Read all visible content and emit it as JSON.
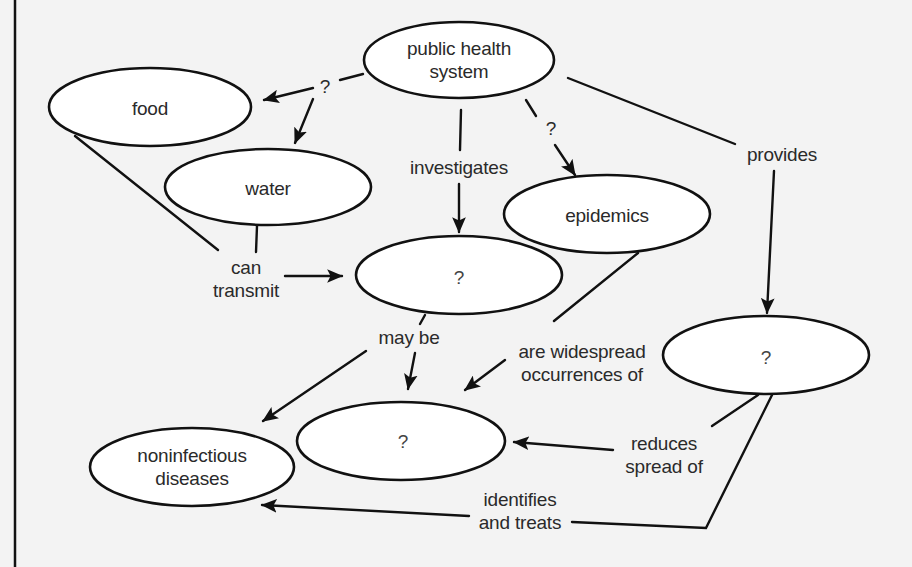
{
  "diagram": {
    "type": "concept-map",
    "colors": {
      "background": "#f3f3f3",
      "node_fill": "#ffffff",
      "stroke": "#111111",
      "text": "#2a2a2a"
    },
    "nodes": [
      {
        "id": "public_health_system",
        "label": "public health\nsystem",
        "cx": 459,
        "cy": 60,
        "rx": 95,
        "ry": 38
      },
      {
        "id": "food",
        "label": "food",
        "cx": 150,
        "cy": 107,
        "rx": 101,
        "ry": 39
      },
      {
        "id": "water",
        "label": "water",
        "cx": 268,
        "cy": 187,
        "rx": 103,
        "ry": 38
      },
      {
        "id": "epidemics",
        "label": "epidemics",
        "cx": 607,
        "cy": 214,
        "rx": 103,
        "ry": 39
      },
      {
        "id": "unknown_center",
        "label": "?",
        "cx": 459,
        "cy": 275,
        "rx": 103,
        "ry": 39
      },
      {
        "id": "unknown_right",
        "label": "?",
        "cx": 766,
        "cy": 355,
        "rx": 103,
        "ry": 39
      },
      {
        "id": "unknown_lower",
        "label": "?",
        "cx": 401,
        "cy": 441,
        "rx": 104,
        "ry": 39
      },
      {
        "id": "noninfectious_diseases",
        "label": "noninfectious\ndiseases",
        "cx": 192,
        "cy": 467,
        "rx": 102,
        "ry": 39
      }
    ],
    "link_labels": [
      {
        "id": "q_food_water",
        "label": "?",
        "x": 325,
        "y": 86
      },
      {
        "id": "investigates",
        "label": "investigates",
        "x": 459,
        "y": 167
      },
      {
        "id": "q_epidemics",
        "label": "?",
        "x": 551,
        "y": 128
      },
      {
        "id": "provides",
        "label": "provides",
        "x": 782,
        "y": 154
      },
      {
        "id": "can_transmit",
        "label": "can\ntransmit",
        "x": 246,
        "y": 279
      },
      {
        "id": "may_be",
        "label": "may be",
        "x": 409,
        "y": 337
      },
      {
        "id": "are_widespread",
        "label": "are widespread\noccurrences of",
        "x": 582,
        "y": 363
      },
      {
        "id": "reduces_spread",
        "label": "reduces\nspread of",
        "x": 664,
        "y": 455
      },
      {
        "id": "identifies_treats",
        "label": "identifies\nand treats",
        "x": 520,
        "y": 511
      }
    ],
    "edges": [
      {
        "from": "public_health_system",
        "via": "?",
        "to": "food"
      },
      {
        "from": "public_health_system",
        "via": "?",
        "to": "water"
      },
      {
        "from": "public_health_system",
        "via": "investigates",
        "to": "unknown_center"
      },
      {
        "from": "public_health_system",
        "via": "?",
        "to": "epidemics"
      },
      {
        "from": "public_health_system",
        "via": "provides",
        "to": "unknown_right"
      },
      {
        "from": "food",
        "via": "can transmit",
        "to": "unknown_center"
      },
      {
        "from": "water",
        "via": "can transmit",
        "to": "unknown_center"
      },
      {
        "from": "unknown_center",
        "via": "may be",
        "to": "noninfectious_diseases"
      },
      {
        "from": "unknown_center",
        "via": "may be",
        "to": "unknown_lower"
      },
      {
        "from": "epidemics",
        "via": "are widespread occurrences of",
        "to": "unknown_lower"
      },
      {
        "from": "unknown_right",
        "via": "reduces spread of",
        "to": "unknown_lower"
      },
      {
        "from": "unknown_right",
        "via": "identifies and treats",
        "to": "noninfectious_diseases"
      }
    ]
  }
}
